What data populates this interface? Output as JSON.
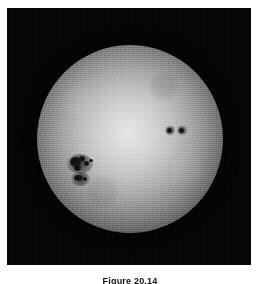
{
  "figure": {
    "caption": "Figure 20.14",
    "alt_description": "White-light photograph of the solar disk showing limb darkening, a large sunspot group on the left-centre of the disk and a pair of small sunspots to the right of disk centre.",
    "plate": {
      "background_color": "#030303",
      "border_color": "#ffffff"
    },
    "disk": {
      "center_color": "#e6e6e6",
      "limb_color": "#0b0b0b",
      "center_x": 130,
      "center_y": 138,
      "radius": 93
    },
    "sunspots": [
      {
        "name": "large-sunspot-group",
        "position": "left-of-center",
        "x": 76,
        "y": 162,
        "umbra_color": "#0a0a0a",
        "penumbra_color": "#3c3c3c"
      },
      {
        "name": "small-sunspot-pair",
        "position": "right-of-center",
        "x": 170,
        "y": 123,
        "umbra_color": "#0a0a0a",
        "penumbra_color": "#3c3c3c"
      }
    ]
  }
}
